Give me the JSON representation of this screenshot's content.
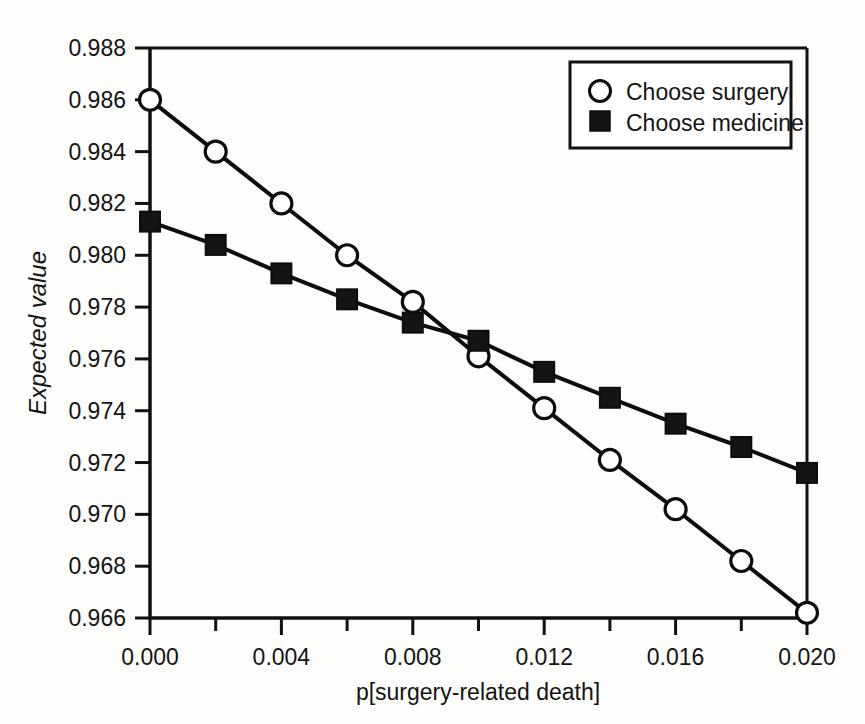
{
  "chart_data": {
    "type": "line",
    "title": "",
    "xlabel": "p[surgery-related death]",
    "ylabel": "Expected value",
    "xlim": [
      0.0,
      0.02
    ],
    "ylim": [
      0.966,
      0.988
    ],
    "grid": false,
    "legend_position": "top-right",
    "x": [
      0.0,
      0.002,
      0.004,
      0.006,
      0.008,
      0.01,
      0.012,
      0.014,
      0.016,
      0.018,
      0.02
    ],
    "xticks": [
      "0.000",
      "0.004",
      "0.008",
      "0.012",
      "0.016",
      "0.020"
    ],
    "xtick_values": [
      0.0,
      0.004,
      0.008,
      0.012,
      0.016,
      0.02
    ],
    "xminor_step": 0.002,
    "yticks": [
      "0.988",
      "0.986",
      "0.984",
      "0.982",
      "0.980",
      "0.978",
      "0.976",
      "0.974",
      "0.972",
      "0.970",
      "0.968",
      "0.966"
    ],
    "ytick_values": [
      0.988,
      0.986,
      0.984,
      0.982,
      0.98,
      0.978,
      0.976,
      0.974,
      0.972,
      0.97,
      0.968,
      0.966
    ],
    "series": [
      {
        "name": "Choose surgery",
        "marker": "open-circle",
        "values": [
          0.986,
          0.984,
          0.982,
          0.98,
          0.9782,
          0.9761,
          0.9741,
          0.9721,
          0.9702,
          0.9682,
          0.9662
        ]
      },
      {
        "name": "Choose medicine",
        "marker": "filled-square",
        "values": [
          0.9813,
          0.9804,
          0.9793,
          0.9783,
          0.9774,
          0.9767,
          0.9755,
          0.9745,
          0.9735,
          0.9726,
          0.9716
        ]
      }
    ]
  },
  "legend": {
    "items": [
      {
        "label": "Choose surgery",
        "marker": "open-circle"
      },
      {
        "label": "Choose medicine",
        "marker": "filled-square"
      }
    ]
  },
  "colors": {
    "line": "#0d0d0d",
    "marker_fill_open": "#ffffff",
    "marker_fill_solid": "#141414",
    "axis": "#111111",
    "background": "#fdfdfc"
  }
}
